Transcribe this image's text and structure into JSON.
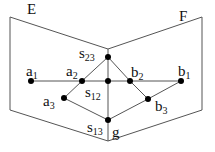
{
  "diagram": {
    "planes": [
      {
        "id": "E",
        "label": "E"
      },
      {
        "id": "F",
        "label": "F"
      }
    ],
    "points": [
      {
        "id": "a1",
        "base": "a",
        "sub": "1"
      },
      {
        "id": "a2",
        "base": "a",
        "sub": "2"
      },
      {
        "id": "a3",
        "base": "a",
        "sub": "3"
      },
      {
        "id": "b1",
        "base": "b",
        "sub": "1"
      },
      {
        "id": "b2",
        "base": "b",
        "sub": "2"
      },
      {
        "id": "b3",
        "base": "b",
        "sub": "3"
      },
      {
        "id": "s12",
        "base": "s",
        "sub": "12"
      },
      {
        "id": "s13",
        "base": "s",
        "sub": "13"
      },
      {
        "id": "s23",
        "base": "s",
        "sub": "23"
      },
      {
        "id": "g",
        "base": "g",
        "sub": ""
      }
    ],
    "edges": [
      [
        "a1",
        "b1"
      ],
      [
        "a2",
        "s23"
      ],
      [
        "s23",
        "b2"
      ],
      [
        "a2",
        "a3"
      ],
      [
        "a3",
        "s13"
      ],
      [
        "b2",
        "b3"
      ],
      [
        "b3",
        "s13"
      ],
      [
        "b3",
        "b1"
      ],
      [
        "s23",
        "s13"
      ]
    ],
    "colors": {
      "line": "#444444",
      "point": "#000000"
    }
  }
}
